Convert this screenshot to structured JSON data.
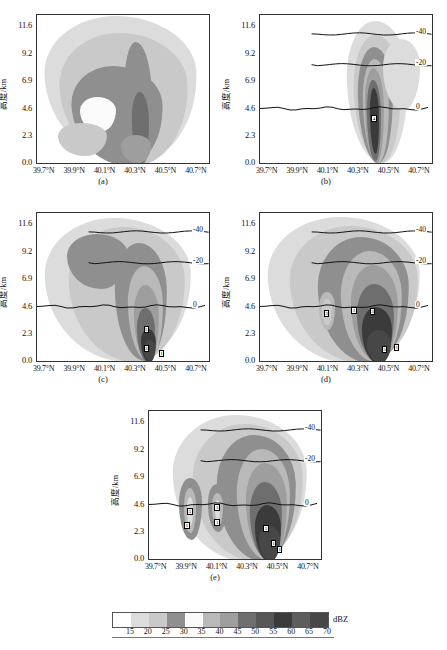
{
  "figure": {
    "unit_label": "dBZ",
    "y_axis_title": "高度/km",
    "y_ticks": [
      "0.0",
      "2.3",
      "4.6",
      "6.9",
      "9.2",
      "11.6"
    ],
    "x_ticks": [
      "39.7°N",
      "39.9°N",
      "40.1°N",
      "40.3°N",
      "40.5°N",
      "40.7°N"
    ],
    "isotherm_labels": [
      "-40",
      "-20",
      "0"
    ],
    "panel_labels": [
      "(a)",
      "(b)",
      "(c)",
      "(d)",
      "(e)"
    ],
    "caption": ""
  },
  "colorbar": {
    "ticks": [
      "15",
      "20",
      "25",
      "30",
      "35",
      "40",
      "45",
      "50",
      "55",
      "60",
      "65",
      "70"
    ],
    "colors": [
      "#ffffff",
      "#dcdcdc",
      "#c9c9c9",
      "#8f8f8f",
      "#fbfbfb",
      "#b9b9b9",
      "#9e9e9e",
      "#6e6e6e",
      "#575757",
      "#3b3b3b",
      "#5d5d5d",
      "#474747"
    ],
    "unit": "dBZ"
  },
  "chart_data": {
    "type": "heatmap",
    "title": "",
    "xlabel": "",
    "ylabel": "高度/km",
    "xlim": [
      39.65,
      40.78
    ],
    "ylim": [
      0.0,
      12.5
    ],
    "x_tick_values": [
      39.7,
      39.9,
      40.1,
      40.3,
      40.5,
      40.7
    ],
    "y_tick_values": [
      0.0,
      2.3,
      4.6,
      6.9,
      9.2,
      11.6
    ],
    "colorbar_levels": [
      15,
      20,
      25,
      30,
      35,
      40,
      45,
      50,
      55,
      60,
      65,
      70
    ],
    "colorbar_unit": "dBZ",
    "grid": false,
    "legend_position": "bottom",
    "isotherms": [
      {
        "label": "-40",
        "height_km": 10.9
      },
      {
        "label": "-20",
        "height_km": 8.3
      },
      {
        "label": "0",
        "height_km": 4.6
      }
    ],
    "panels": [
      {
        "id": "a",
        "label": "(a)",
        "description": "Observed reflectivity cross-section, broad ragged echo",
        "isotherms_drawn": false,
        "max_dbz": 55,
        "core_latitude": 40.32,
        "core_height_km": 1.5,
        "echo_top_km": 12.5,
        "echo_lat_range": [
          39.72,
          40.68
        ]
      },
      {
        "id": "b",
        "label": "(b)",
        "description": "Narrow single convective core",
        "isotherms_drawn": true,
        "max_dbz": 60,
        "core_latitude": 40.4,
        "core_height_km": 3.6,
        "echo_top_km": 12.2,
        "echo_lat_range": [
          40.2,
          40.68
        ],
        "contour_markers": [
          {
            "value": "4",
            "lat": 40.4,
            "height_km": 3.7
          }
        ]
      },
      {
        "id": "c",
        "label": "(c)",
        "description": "Broad echo with deep anvil aloft",
        "isotherms_drawn": true,
        "max_dbz": 65,
        "core_latitude": 40.38,
        "core_height_km": 1.2,
        "echo_top_km": 12.3,
        "echo_lat_range": [
          39.72,
          40.7
        ],
        "contour_markers": [
          {
            "value": "3",
            "lat": 40.37,
            "height_km": 2.6
          },
          {
            "value": "3",
            "lat": 40.37,
            "height_km": 1.0
          },
          {
            "value": "1",
            "lat": 40.47,
            "height_km": 0.6
          }
        ]
      },
      {
        "id": "d",
        "label": "(d)",
        "description": "Wide intense core plus secondary west cell",
        "isotherms_drawn": true,
        "max_dbz": 70,
        "core_latitude": 40.4,
        "core_height_km": 1.0,
        "echo_top_km": 12.4,
        "echo_lat_range": [
          39.72,
          40.72
        ],
        "contour_markers": [
          {
            "value": "3",
            "lat": 40.09,
            "height_km": 4.0
          },
          {
            "value": "3",
            "lat": 40.27,
            "height_km": 4.2
          },
          {
            "value": "3",
            "lat": 40.39,
            "height_km": 4.1
          },
          {
            "value": "3",
            "lat": 40.47,
            "height_km": 0.9
          },
          {
            "value": "1",
            "lat": 40.55,
            "height_km": 1.1
          }
        ]
      },
      {
        "id": "e",
        "label": "(e)",
        "description": "Three cells: two weak west cells and main east core",
        "isotherms_drawn": true,
        "max_dbz": 70,
        "core_latitude": 40.42,
        "core_height_km": 1.2,
        "echo_top_km": 12.4,
        "echo_lat_range": [
          39.8,
          40.72
        ],
        "contour_markers": [
          {
            "value": "3",
            "lat": 39.92,
            "height_km": 4.0
          },
          {
            "value": "1",
            "lat": 39.9,
            "height_km": 2.8
          },
          {
            "value": "3",
            "lat": 40.1,
            "height_km": 4.3
          },
          {
            "value": "1",
            "lat": 40.1,
            "height_km": 3.0
          },
          {
            "value": "5",
            "lat": 40.42,
            "height_km": 2.5
          },
          {
            "value": "1",
            "lat": 40.47,
            "height_km": 1.3
          },
          {
            "value": "1",
            "lat": 40.51,
            "height_km": 0.8
          }
        ]
      }
    ]
  }
}
